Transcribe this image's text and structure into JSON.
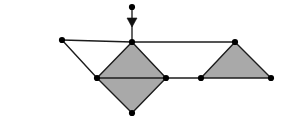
{
  "figure": {
    "canvas": {
      "width": 288,
      "height": 129,
      "background": "#ffffff"
    },
    "style": {
      "fill_color": "#a9a9a9",
      "edge_color": "#1c1c1c",
      "vertex_color": "#000000",
      "arrow_color": "#111111",
      "edge_width": 1.4,
      "vertex_radius": 3.1
    },
    "vertices": [
      {
        "id": "v-arrow-tail",
        "label": "arrow-tail-node",
        "x": 132,
        "y": 7
      },
      {
        "id": "v-apex-left",
        "label": "rhombus-top",
        "x": 132,
        "y": 42
      },
      {
        "id": "v-left-end",
        "label": "left-end-node",
        "x": 62,
        "y": 40
      },
      {
        "id": "v-rhombus-left",
        "label": "rhombus-left",
        "x": 97,
        "y": 78
      },
      {
        "id": "v-rhombus-right",
        "label": "rhombus-right",
        "x": 166,
        "y": 78
      },
      {
        "id": "v-rhombus-bottom",
        "label": "rhombus-bottom",
        "x": 132,
        "y": 113
      },
      {
        "id": "v-tri-left",
        "label": "triangle-bottom-left",
        "x": 201,
        "y": 78
      },
      {
        "id": "v-tri-apex",
        "label": "triangle-apex",
        "x": 235,
        "y": 42
      },
      {
        "id": "v-tri-right",
        "label": "triangle-bottom-right",
        "x": 271,
        "y": 78
      }
    ],
    "faces": [
      {
        "id": "face-rhombus-upper",
        "label": "rhombus-upper-triangle",
        "points": "132,42 97,78 166,78",
        "filled": true
      },
      {
        "id": "face-rhombus-lower",
        "label": "rhombus-lower-triangle",
        "points": "97,78 166,78 132,113",
        "filled": true
      },
      {
        "id": "face-triangle-right",
        "label": "right-triangle",
        "points": "235,42 201,78 271,78",
        "filled": true
      }
    ],
    "edges": [
      {
        "id": "e-top-left",
        "label": "edge-left-end-to-apex",
        "x1": 62,
        "y1": 40,
        "x2": 132,
        "y2": 42
      },
      {
        "id": "e-top-right",
        "label": "edge-apex-to-triangle-apex",
        "x1": 132,
        "y1": 42,
        "x2": 235,
        "y2": 42
      },
      {
        "id": "e-left-diag",
        "label": "edge-left-end-to-rhombus-left",
        "x1": 62,
        "y1": 40,
        "x2": 97,
        "y2": 78
      },
      {
        "id": "e-rhombus-ul",
        "label": "edge-rhombus-top-left",
        "x1": 132,
        "y1": 42,
        "x2": 97,
        "y2": 78
      },
      {
        "id": "e-rhombus-ur",
        "label": "edge-rhombus-top-right",
        "x1": 132,
        "y1": 42,
        "x2": 166,
        "y2": 78
      },
      {
        "id": "e-rhombus-ll",
        "label": "edge-rhombus-bottom-left",
        "x1": 97,
        "y1": 78,
        "x2": 132,
        "y2": 113
      },
      {
        "id": "e-rhombus-lr",
        "label": "edge-rhombus-bottom-right",
        "x1": 166,
        "y1": 78,
        "x2": 132,
        "y2": 113
      },
      {
        "id": "e-rhombus-mid",
        "label": "edge-rhombus-horizontal-diagonal",
        "x1": 97,
        "y1": 78,
        "x2": 166,
        "y2": 78
      },
      {
        "id": "e-gap",
        "label": "edge-rhombus-right-to-triangle-left",
        "x1": 166,
        "y1": 78,
        "x2": 201,
        "y2": 78
      },
      {
        "id": "e-tri-left",
        "label": "edge-triangle-left-side",
        "x1": 201,
        "y1": 78,
        "x2": 235,
        "y2": 42
      },
      {
        "id": "e-tri-right",
        "label": "edge-triangle-right-side",
        "x1": 235,
        "y1": 42,
        "x2": 271,
        "y2": 78
      },
      {
        "id": "e-tri-base",
        "label": "edge-triangle-base",
        "x1": 201,
        "y1": 78,
        "x2": 271,
        "y2": 78
      }
    ],
    "arrow": {
      "label": "downward-load-arrow",
      "direction": "down",
      "stem_x": 132,
      "stem_top_y": 7,
      "stem_bottom_y": 42,
      "head_center_x": 132,
      "head_top_y": 18,
      "head_tip_y": 27,
      "head_half_width": 5,
      "head_points": "127,18 137,18 132,27"
    }
  }
}
